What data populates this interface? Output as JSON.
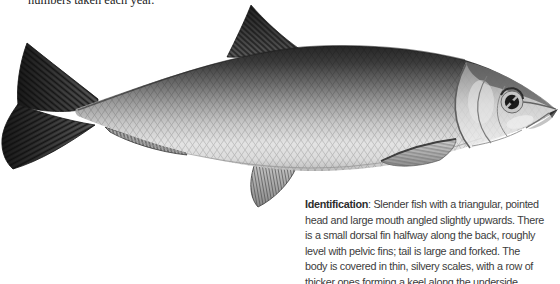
{
  "top_caption": {
    "text": "numbers taken each year.",
    "color": "#1c1c1c"
  },
  "identification": {
    "label": "Identification",
    "lines": [
      ": Slender fish with a triangular, pointed",
      "head and large mouth angled slightly upwards. There",
      "is a small dorsal fin halfway along the back, roughly",
      "level with pelvic fins; tail is large and forked. The",
      "body is covered in thin, silvery scales, with a row of",
      "thicker ones forming a keel along the underside."
    ],
    "text_color": "#3c3c3c"
  },
  "illustration": {
    "description": "Monochrome painting of a slender silvery herring-like fish in side view, facing right, with forked tail, small dorsal fin, pelvic, anal and pectoral fins",
    "palette": {
      "background": "#ffffff",
      "back": "#262626",
      "flank": "#9d9d9d",
      "belly": "#e3e3e3",
      "fin_dark": "#2a2a2a",
      "fin_light": "#a8a8a8"
    }
  }
}
